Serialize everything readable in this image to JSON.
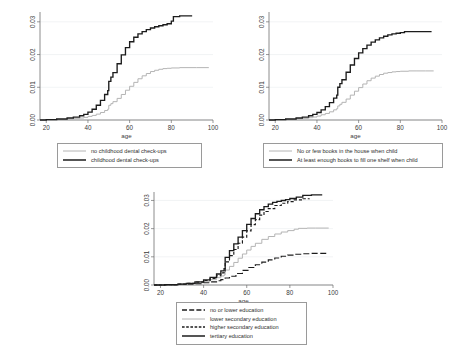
{
  "figure": {
    "panel_count": 3,
    "shared_xlabel": "age",
    "background": "#ffffff"
  },
  "colors": {
    "black": "#1c1c1c",
    "gray": "#b4b4b4",
    "axis": "#6e6e6e",
    "grid": "#eceff1",
    "legend_border": "#9a9a9a"
  },
  "chart_data": [
    {
      "id": "panel-dental",
      "type": "line",
      "title": "",
      "xlabel": "age",
      "ylabel": "",
      "xlim": [
        17,
        100
      ],
      "ylim": [
        0,
        0.033
      ],
      "xticks": [
        20,
        40,
        60,
        80,
        100
      ],
      "yticks": [
        0.0,
        0.01,
        0.02,
        0.03
      ],
      "ytick_labels": [
        "0.00",
        "0.01",
        "0.02",
        "0.03"
      ],
      "xtick_labels": [
        "20",
        "40",
        "60",
        "80",
        "100"
      ],
      "grid": true,
      "legend_position": "below",
      "series": [
        {
          "name": "no childhood dental check-ups",
          "style": "solid",
          "color": "#b4b4b4",
          "x": [
            17,
            20,
            25,
            30,
            33,
            36,
            38,
            40,
            42,
            44,
            46,
            48,
            49.5,
            50,
            51,
            52,
            54,
            56,
            58,
            60,
            62,
            64,
            66,
            68,
            70,
            72,
            74,
            76,
            78,
            80,
            84,
            88,
            92,
            98
          ],
          "y": [
            0.0,
            0.0001,
            0.0002,
            0.0003,
            0.0004,
            0.0006,
            0.0008,
            0.0011,
            0.0014,
            0.0018,
            0.0023,
            0.0029,
            0.0033,
            0.0045,
            0.005,
            0.0056,
            0.0066,
            0.0078,
            0.0091,
            0.0103,
            0.0115,
            0.0126,
            0.0135,
            0.0142,
            0.0148,
            0.0152,
            0.0155,
            0.0157,
            0.0158,
            0.0159,
            0.016,
            0.016,
            0.016,
            0.016
          ]
        },
        {
          "name": "childhood dental check-ups",
          "style": "solid",
          "color": "#1c1c1c",
          "x": [
            17,
            20,
            25,
            30,
            33,
            36,
            38,
            40,
            42,
            44,
            46,
            48,
            49.5,
            50,
            51,
            52,
            54,
            56,
            58,
            60,
            62,
            64,
            66,
            68,
            70,
            72,
            74,
            76,
            78,
            80,
            81,
            84,
            88,
            90
          ],
          "y": [
            0.0,
            0.0001,
            0.0003,
            0.0006,
            0.0009,
            0.0013,
            0.0017,
            0.0024,
            0.0033,
            0.0045,
            0.006,
            0.0078,
            0.009,
            0.0118,
            0.0131,
            0.0145,
            0.0172,
            0.0199,
            0.0221,
            0.0239,
            0.0253,
            0.0263,
            0.027,
            0.0276,
            0.0281,
            0.0285,
            0.0288,
            0.0291,
            0.0294,
            0.0302,
            0.0316,
            0.0318,
            0.0318,
            0.0318
          ]
        }
      ]
    },
    {
      "id": "panel-books",
      "type": "line",
      "title": "",
      "xlabel": "age",
      "ylabel": "",
      "xlim": [
        17,
        100
      ],
      "ylim": [
        0,
        0.033
      ],
      "xticks": [
        20,
        40,
        60,
        80,
        100
      ],
      "yticks": [
        0.0,
        0.01,
        0.02,
        0.03
      ],
      "ytick_labels": [
        "0.00",
        "0.01",
        "0.02",
        "0.03"
      ],
      "xtick_labels": [
        "20",
        "40",
        "60",
        "80",
        "100"
      ],
      "grid": true,
      "legend_position": "below",
      "series": [
        {
          "name": "No or few books in the house when child",
          "style": "solid",
          "color": "#b4b4b4",
          "x": [
            17,
            20,
            25,
            30,
            33,
            36,
            38,
            40,
            42,
            44,
            46,
            48,
            49.5,
            50,
            51,
            52,
            54,
            56,
            58,
            60,
            62,
            64,
            66,
            68,
            70,
            72,
            74,
            76,
            78,
            80,
            84,
            88,
            92,
            96
          ],
          "y": [
            0.0,
            0.0001,
            0.0002,
            0.0004,
            0.0005,
            0.0007,
            0.0009,
            0.0012,
            0.0016,
            0.002,
            0.0025,
            0.0031,
            0.0035,
            0.0043,
            0.0048,
            0.0054,
            0.0064,
            0.0076,
            0.0088,
            0.0099,
            0.011,
            0.012,
            0.0128,
            0.0134,
            0.0139,
            0.0143,
            0.0145,
            0.0147,
            0.0148,
            0.0149,
            0.015,
            0.015,
            0.015,
            0.015
          ]
        },
        {
          "name": "At least enough books to fill one shelf when child",
          "style": "solid",
          "color": "#1c1c1c",
          "x": [
            17,
            20,
            25,
            30,
            33,
            36,
            38,
            40,
            42,
            44,
            46,
            48,
            49.5,
            50,
            51,
            52,
            54,
            56,
            58,
            60,
            62,
            64,
            66,
            68,
            70,
            72,
            74,
            76,
            78,
            80,
            82,
            86,
            90,
            95
          ],
          "y": [
            0.0,
            0.0001,
            0.0003,
            0.0006,
            0.0009,
            0.0013,
            0.0017,
            0.0023,
            0.0031,
            0.0041,
            0.0053,
            0.0067,
            0.0076,
            0.01,
            0.0111,
            0.0123,
            0.0146,
            0.0168,
            0.0188,
            0.0205,
            0.0218,
            0.0229,
            0.0238,
            0.0245,
            0.0251,
            0.0256,
            0.026,
            0.0263,
            0.0265,
            0.0267,
            0.027,
            0.027,
            0.027,
            0.027
          ]
        }
      ]
    },
    {
      "id": "panel-education",
      "type": "line",
      "title": "",
      "xlabel": "age",
      "ylabel": "",
      "xlim": [
        17,
        100
      ],
      "ylim": [
        0,
        0.033
      ],
      "xticks": [
        20,
        40,
        60,
        80,
        100
      ],
      "yticks": [
        0.0,
        0.01,
        0.02,
        0.03
      ],
      "ytick_labels": [
        "0.00",
        "0.01",
        "0.02",
        "0.03"
      ],
      "xtick_labels": [
        "20",
        "40",
        "60",
        "80",
        "100"
      ],
      "grid": true,
      "legend_position": "below",
      "series": [
        {
          "name": "no or lower education",
          "style": "long-dash",
          "color": "#1c1c1c",
          "x": [
            17,
            22,
            28,
            32,
            36,
            40,
            43,
            46,
            48,
            50,
            52,
            55,
            58,
            61,
            64,
            67,
            70,
            73,
            76,
            79,
            82,
            86,
            90,
            95,
            98
          ],
          "y": [
            0.0,
            0.0001,
            0.0002,
            0.0003,
            0.0005,
            0.0008,
            0.0011,
            0.0015,
            0.0019,
            0.0025,
            0.0031,
            0.0041,
            0.0052,
            0.0062,
            0.0072,
            0.0081,
            0.0089,
            0.0096,
            0.0102,
            0.0106,
            0.0109,
            0.0111,
            0.0112,
            0.0112,
            0.0112
          ]
        },
        {
          "name": "lower secondary education",
          "style": "solid",
          "color": "#b4b4b4",
          "x": [
            17,
            22,
            28,
            32,
            36,
            40,
            43,
            46,
            48,
            49.5,
            50,
            52,
            54,
            56,
            58,
            60,
            62,
            64,
            67,
            70,
            73,
            76,
            79,
            82,
            84,
            88,
            92,
            98
          ],
          "y": [
            0.0,
            0.0001,
            0.0003,
            0.0005,
            0.0008,
            0.0013,
            0.0019,
            0.0026,
            0.0032,
            0.0036,
            0.0053,
            0.0066,
            0.008,
            0.0095,
            0.011,
            0.0124,
            0.0137,
            0.0148,
            0.0162,
            0.0172,
            0.0181,
            0.0188,
            0.0193,
            0.0198,
            0.0201,
            0.0202,
            0.0202,
            0.0202
          ]
        },
        {
          "name": "higher secondary education",
          "style": "short-dash",
          "color": "#1c1c1c",
          "x": [
            17,
            22,
            28,
            32,
            36,
            40,
            43,
            46,
            48,
            49.5,
            50,
            52,
            54,
            56,
            58,
            60,
            62,
            64,
            66,
            68,
            70,
            73,
            76,
            79,
            82,
            86,
            89
          ],
          "y": [
            0.0,
            0.0001,
            0.0003,
            0.0006,
            0.001,
            0.0016,
            0.0023,
            0.0033,
            0.0043,
            0.005,
            0.0082,
            0.0104,
            0.0126,
            0.0148,
            0.017,
            0.0192,
            0.0214,
            0.0232,
            0.0248,
            0.0261,
            0.0271,
            0.0282,
            0.029,
            0.0296,
            0.0302,
            0.0306,
            0.0307
          ]
        },
        {
          "name": "tertiary education",
          "style": "solid",
          "color": "#1c1c1c",
          "x": [
            17,
            22,
            28,
            32,
            36,
            40,
            43,
            46,
            48,
            49.5,
            50,
            52,
            54,
            56,
            58,
            60,
            62,
            64,
            66,
            68,
            70,
            72,
            74,
            76,
            78,
            80,
            83,
            86,
            90,
            95
          ],
          "y": [
            0.0,
            0.0001,
            0.0003,
            0.0006,
            0.0011,
            0.0018,
            0.0027,
            0.0039,
            0.005,
            0.0058,
            0.0098,
            0.0122,
            0.0146,
            0.017,
            0.0193,
            0.0215,
            0.0236,
            0.0253,
            0.0267,
            0.0278,
            0.0287,
            0.0293,
            0.0297,
            0.03,
            0.0303,
            0.0307,
            0.0312,
            0.0318,
            0.032,
            0.032
          ]
        }
      ]
    }
  ],
  "legends": {
    "dental": [
      {
        "label": "no childhood dental check-ups",
        "style": "solid",
        "color": "#b4b4b4"
      },
      {
        "label": "childhood dental check-ups",
        "style": "solid",
        "color": "#1c1c1c"
      }
    ],
    "books": [
      {
        "label": "No or few books in the house when child",
        "style": "solid",
        "color": "#b4b4b4"
      },
      {
        "label": "At least enough books to fill one shelf when child",
        "style": "solid",
        "color": "#1c1c1c"
      }
    ],
    "education": [
      {
        "label": "no or lower education",
        "style": "long-dash",
        "color": "#1c1c1c"
      },
      {
        "label": "lower secondary education",
        "style": "solid",
        "color": "#b4b4b4"
      },
      {
        "label": "higher secondary education",
        "style": "short-dash",
        "color": "#1c1c1c"
      },
      {
        "label": "tertiary education",
        "style": "solid",
        "color": "#1c1c1c"
      }
    ]
  }
}
